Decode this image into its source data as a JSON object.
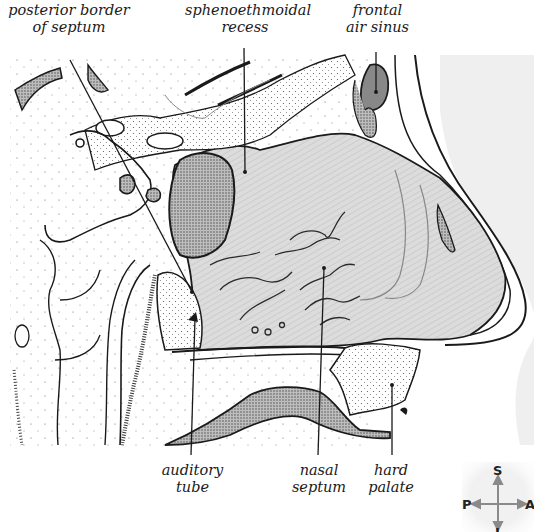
{
  "figure": {
    "colors": {
      "line": "#1a1a1a",
      "cavity_fill": "#d9d9d9",
      "skin_fill": "#efefef",
      "stipple": "#3a3a3a",
      "sinus_fill": "#9a9a9a"
    }
  },
  "labels": {
    "top": [
      {
        "id": "posterior-border",
        "lines": [
          "posterior border",
          "of septum"
        ]
      },
      {
        "id": "sphenoethmoidal",
        "lines": [
          "sphenoethmoidal",
          "recess"
        ]
      },
      {
        "id": "frontal-sinus",
        "lines": [
          "frontal",
          "air sinus"
        ]
      }
    ],
    "bottom": [
      {
        "id": "auditory-tube",
        "lines": [
          "auditory",
          "tube"
        ]
      },
      {
        "id": "nasal-septum",
        "lines": [
          "nasal",
          "septum"
        ]
      },
      {
        "id": "hard-palate",
        "lines": [
          "hard",
          "palate"
        ]
      }
    ]
  },
  "compass": {
    "superior": "S",
    "posterior": "P",
    "anterior": "A",
    "inferior": "I"
  }
}
